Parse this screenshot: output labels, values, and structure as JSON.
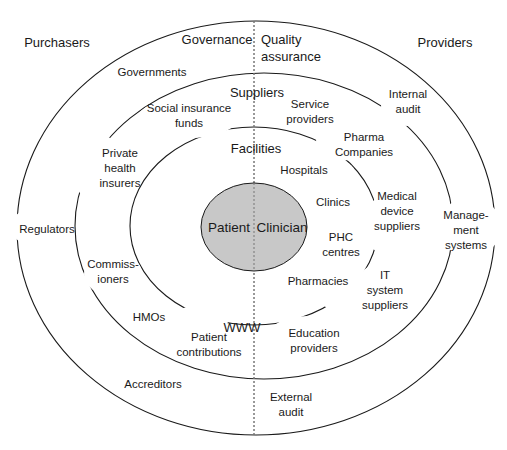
{
  "diagram": {
    "colors": {
      "core_fill": "#c8c8c8",
      "stroke": "#1a1a1a",
      "background": "#ffffff"
    },
    "corner_labels": {
      "purchasers": "Purchasers",
      "providers": "Providers"
    },
    "outer_ring": {
      "left_title": "Governance",
      "right_title": "Quality\nassurance",
      "items": {
        "governments": "Governments",
        "internal_audit": "Internal\naudit",
        "regulators": "Regulators",
        "management_systems": "Manage-\nment\nsystems",
        "accreditors": "Accreditors",
        "external_audit": "External\naudit"
      }
    },
    "middle_ring": {
      "title": "Suppliers",
      "items": {
        "social_insurance_funds": "Social insurance\nfunds",
        "service_providers": "Service\nproviders",
        "private_health_insurers": "Private\nhealth\ninsurers",
        "pharma_companies": "Pharma\nCompanies",
        "medical_device_suppliers": "Medical\ndevice\nsuppliers",
        "commissioners": "Commiss-\nioners",
        "it_system_suppliers": "IT\nsystem\nsuppliers",
        "hmos": "HMOs",
        "patient_contributions": "Patient\ncontributions",
        "education_providers": "Education\nproviders"
      }
    },
    "inner_ring": {
      "title": "Facilities",
      "items": {
        "hospitals": "Hospitals",
        "clinics": "Clinics",
        "phc_centres": "PHC\ncentres",
        "pharmacies": "Pharmacies",
        "www": "WWW"
      }
    },
    "core": {
      "left": "Patient",
      "right": "Clinician"
    }
  }
}
